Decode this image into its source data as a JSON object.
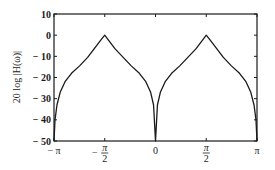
{
  "chart_data": {
    "type": "line",
    "title": "",
    "xlabel": "",
    "ylabel": "20 log |H(ω)|",
    "xlim": [
      -3.14159,
      3.14159
    ],
    "ylim": [
      -50,
      10
    ],
    "grid": false,
    "legend": null,
    "x_ticks": [
      {
        "value": -3.14159,
        "label": "− π"
      },
      {
        "value": -1.5708,
        "label": "− π/2",
        "num": "π",
        "den": "2",
        "sign": "−"
      },
      {
        "value": 0,
        "label": "0"
      },
      {
        "value": 1.5708,
        "label": "π/2",
        "num": "π",
        "den": "2",
        "sign": ""
      },
      {
        "value": 3.14159,
        "label": "π"
      }
    ],
    "y_ticks": [
      {
        "value": 10,
        "label": "10"
      },
      {
        "value": 0,
        "label": "0"
      },
      {
        "value": -10,
        "label": "− 10"
      },
      {
        "value": -20,
        "label": "− 20"
      },
      {
        "value": -30,
        "label": "− 30"
      },
      {
        "value": -40,
        "label": "− 40"
      },
      {
        "value": -50,
        "label": "− 50"
      }
    ],
    "series": [
      {
        "name": "20 log |H(ω)|",
        "color": "#1a1a1a",
        "x": [
          -3.14159,
          -3.11,
          -3.05,
          -2.95,
          -2.8,
          -2.6,
          -2.35,
          -2.1,
          -1.9,
          -1.7,
          -1.5708,
          -1.45,
          -1.25,
          -1.0,
          -0.75,
          -0.5,
          -0.3,
          -0.15,
          -0.06,
          0,
          0.06,
          0.15,
          0.3,
          0.5,
          0.75,
          1.0,
          1.25,
          1.45,
          1.5708,
          1.7,
          1.9,
          2.1,
          2.35,
          2.6,
          2.8,
          2.95,
          3.05,
          3.11,
          3.14159
        ],
        "y": [
          -50,
          -40,
          -33,
          -27,
          -22,
          -18,
          -14.5,
          -10.5,
          -6.5,
          -2.5,
          0,
          -2.5,
          -6.5,
          -10.5,
          -14.5,
          -18,
          -22,
          -27,
          -33,
          -50,
          -33,
          -27,
          -22,
          -18,
          -14.5,
          -10.5,
          -6.5,
          -2.5,
          0,
          -2.5,
          -6.5,
          -10.5,
          -14.5,
          -18,
          -22,
          -27,
          -33,
          -40,
          -50
        ]
      }
    ]
  }
}
